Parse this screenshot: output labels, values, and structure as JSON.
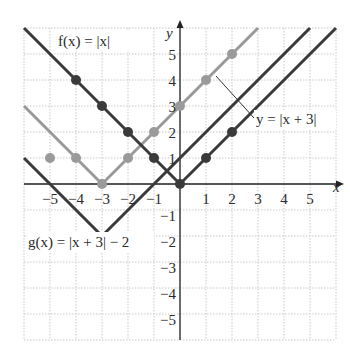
{
  "chart_data": {
    "type": "line",
    "title": "",
    "xlabel": "x",
    "ylabel": "y",
    "xlim": [
      -6,
      6
    ],
    "ylim": [
      -6,
      6
    ],
    "grid": true,
    "x_ticks": [
      -5,
      -4,
      -3,
      -2,
      -1,
      1,
      2,
      3,
      4,
      5
    ],
    "y_ticks": [
      -5,
      -4,
      -3,
      -2,
      -1,
      1,
      2,
      3,
      4,
      5
    ],
    "series": [
      {
        "name": "f(x) = |x|",
        "color": "#3a3a3a",
        "vertex": [
          0,
          0
        ],
        "line": [
          [
            -6,
            6
          ],
          [
            0,
            0
          ],
          [
            6,
            6
          ]
        ],
        "points": [
          [
            -4,
            4
          ],
          [
            -3,
            3
          ],
          [
            -2,
            2
          ],
          [
            -1,
            1
          ],
          [
            0,
            0
          ],
          [
            1,
            1
          ],
          [
            2,
            2
          ]
        ]
      },
      {
        "name": "y = |x + 3|",
        "color": "#9a9a9a",
        "vertex": [
          -3,
          0
        ],
        "line": [
          [
            -6,
            3
          ],
          [
            -3,
            0
          ],
          [
            3,
            6
          ]
        ],
        "points": [
          [
            -5,
            1
          ],
          [
            -4,
            1
          ],
          [
            -3,
            0
          ],
          [
            -2,
            1
          ],
          [
            -1,
            2
          ],
          [
            0,
            3
          ],
          [
            1,
            4
          ],
          [
            2,
            5
          ]
        ]
      },
      {
        "name": "g(x) = |x + 3| − 2",
        "color": "#3a3a3a",
        "vertex": [
          -3,
          -2
        ],
        "line": [
          [
            -6,
            1
          ],
          [
            -3,
            -2
          ],
          [
            5,
            6
          ]
        ],
        "points": []
      }
    ],
    "annotations": [
      {
        "text": "f(x) = |x|",
        "pos": "top-left"
      },
      {
        "text": "y = |x + 3|",
        "pos": "right, with leader line to gray curve"
      },
      {
        "text": "g(x) = |x + 3| − 2",
        "pos": "lower-left"
      }
    ]
  },
  "labels": {
    "f": "f(x) = |x|",
    "y3": "y = |x + 3|",
    "g": "g(x) = |x + 3| − 2",
    "x_axis": "x",
    "y_axis": "y"
  }
}
